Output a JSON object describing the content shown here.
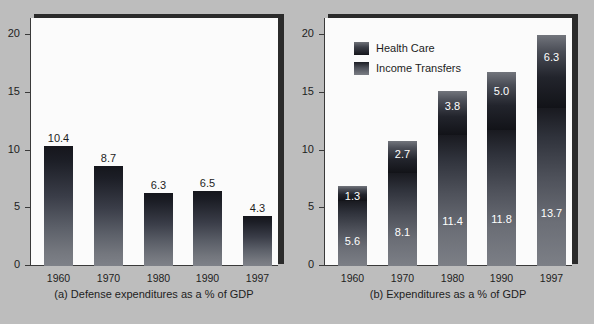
{
  "figure": {
    "background_color": "#bdbdbd",
    "panel_background_color": "#fbfbfb",
    "shadow_color": "#2b2b2b"
  },
  "panel_a": {
    "caption": "(a) Defense expenditures as a % of GDP",
    "yticks": [
      "0",
      "5",
      "10",
      "15",
      "20"
    ],
    "xticks": [
      "1960",
      "1970",
      "1980",
      "1990",
      "1997"
    ]
  },
  "panel_b": {
    "caption": "(b) Expenditures as a % of GDP",
    "yticks": [
      "0",
      "5",
      "10",
      "15",
      "20"
    ],
    "xticks": [
      "1960",
      "1970",
      "1980",
      "1990",
      "1997"
    ],
    "legend": {
      "items": [
        {
          "label": "Health Care",
          "swatch": "health-care-swatch"
        },
        {
          "label": "Income Transfers",
          "swatch": "income-transfers-swatch"
        }
      ]
    },
    "values_health": [
      "1.3",
      "2.7",
      "3.8",
      "5.0",
      "6.3"
    ],
    "values_income": [
      "5.6",
      "8.1",
      "11.4",
      "11.8",
      "13.7"
    ]
  },
  "chart_data": [
    {
      "type": "bar",
      "title": "(a) Defense expenditures as a % of GDP",
      "xlabel": "",
      "ylabel": "",
      "categories": [
        "1960",
        "1970",
        "1980",
        "1990",
        "1997"
      ],
      "values": [
        10.4,
        8.7,
        6.3,
        6.5,
        4.3
      ],
      "data_labels": [
        "10.4",
        "8.7",
        "6.3",
        "6.5",
        "4.3"
      ],
      "ylim": [
        0,
        21.5
      ],
      "yticks": [
        0,
        5,
        10,
        15,
        20
      ],
      "grid": false,
      "legend_position": "none"
    },
    {
      "type": "bar",
      "subtype": "stacked",
      "title": "(b) Expenditures as a % of GDP",
      "xlabel": "",
      "ylabel": "",
      "categories": [
        "1960",
        "1970",
        "1980",
        "1990",
        "1997"
      ],
      "series": [
        {
          "name": "Income Transfers",
          "values": [
            5.6,
            8.1,
            11.4,
            11.8,
            13.7
          ]
        },
        {
          "name": "Health Care",
          "values": [
            1.3,
            2.7,
            3.8,
            5.0,
            6.3
          ]
        }
      ],
      "totals": [
        6.9,
        10.8,
        15.2,
        16.8,
        20.0
      ],
      "ylim": [
        0,
        21.5
      ],
      "yticks": [
        0,
        5,
        10,
        15,
        20
      ],
      "grid": false,
      "legend_position": "upper-left"
    }
  ]
}
